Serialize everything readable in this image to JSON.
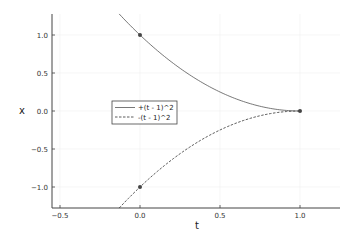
{
  "chart_data": {
    "type": "line",
    "title": "",
    "xlabel": "t",
    "ylabel": "x",
    "xlim": [
      -0.625,
      1.25
    ],
    "ylim": [
      -1.276,
      1.276
    ],
    "xticks": [
      -0.5,
      0.0,
      0.5,
      1.0
    ],
    "xtick_labels": [
      "-0.5",
      "0.0",
      "0.5",
      "1.0"
    ],
    "yticks": [
      -1.0,
      -0.5,
      0.0,
      0.5,
      1.0
    ],
    "ytick_labels": [
      "-1.0",
      "-0.5",
      "0.0",
      "0.5",
      "1.0"
    ],
    "grid": true,
    "legend_position": "inside-left-center",
    "series": [
      {
        "name": "+(t - 1)^2",
        "style": "solid",
        "color": "#555555",
        "formula": "(t-1)^2",
        "t_range": [
          -0.13,
          1.0
        ],
        "x": [
          -0.13,
          0.0,
          0.25,
          0.5,
          0.75,
          1.0
        ],
        "values": [
          1.276,
          1.0,
          0.5625,
          0.25,
          0.0625,
          0.0
        ]
      },
      {
        "name": "-(t - 1)^2",
        "style": "dashed",
        "color": "#333333",
        "formula": "-(t-1)^2",
        "t_range": [
          -0.13,
          1.0
        ],
        "x": [
          -0.13,
          0.0,
          0.25,
          0.5,
          0.75,
          1.0
        ],
        "values": [
          -1.276,
          -1.0,
          -0.5625,
          -0.25,
          -0.0625,
          0.0
        ]
      }
    ],
    "markers": [
      {
        "t": 0.0,
        "x": 1.0
      },
      {
        "t": 0.0,
        "x": -1.0
      },
      {
        "t": 1.0,
        "x": 0.0
      }
    ]
  }
}
